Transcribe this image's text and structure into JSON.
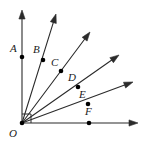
{
  "figure": {
    "kind": "geometry-diagram",
    "width": 143,
    "height": 142,
    "background_color": "#ffffff",
    "stroke_color": "#2b2b2b",
    "point_color": "#000000",
    "label_color": "#1a1a1a",
    "vertex": {
      "name": "O",
      "label": "O",
      "x": 22,
      "y": 123,
      "label_x": 9,
      "label_y": 128
    },
    "right_angle_marker": {
      "name": "right-angle-at-O",
      "size": 9,
      "shown": true
    },
    "rays": [
      {
        "id": "ray-OA",
        "label": "A",
        "tip_x": 22,
        "tip_y": 10,
        "point_x": 22,
        "point_y": 57,
        "label_x": 10,
        "label_y": 43,
        "angle_deg": 90
      },
      {
        "id": "ray-OB",
        "label": "B",
        "tip_x": 56,
        "tip_y": 14,
        "point_x": 43,
        "point_y": 60,
        "label_x": 33,
        "label_y": 44,
        "angle_deg": 73
      },
      {
        "id": "ray-OC",
        "label": "C",
        "tip_x": 90,
        "tip_y": 32,
        "point_x": 61,
        "point_y": 71,
        "label_x": 51,
        "label_y": 57,
        "angle_deg": 56
      },
      {
        "id": "ray-OD",
        "label": "D",
        "tip_x": 119,
        "tip_y": 55,
        "point_x": 78,
        "point_y": 87,
        "label_x": 68,
        "label_y": 72,
        "angle_deg": 38
      },
      {
        "id": "ray-OE",
        "label": "E",
        "tip_x": 133,
        "tip_y": 82,
        "point_x": 88,
        "point_y": 104,
        "label_x": 79,
        "label_y": 89,
        "angle_deg": 22
      },
      {
        "id": "ray-OF",
        "label": "F",
        "tip_x": 138,
        "tip_y": 123,
        "point_x": 89,
        "point_y": 123,
        "label_x": 85,
        "label_y": 106,
        "angle_deg": 0
      }
    ]
  }
}
